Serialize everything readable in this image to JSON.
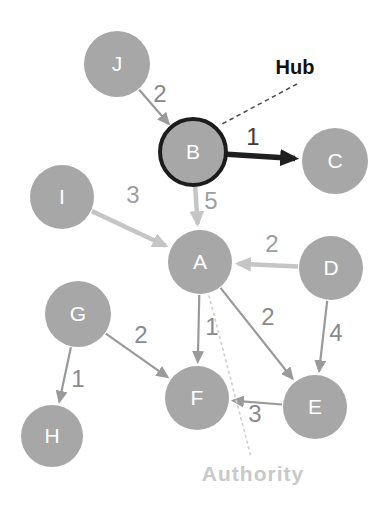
{
  "figure": {
    "width": 387,
    "height": 510
  },
  "colors": {
    "background": "#ffffff",
    "node_fill": "#a7a7a7",
    "node_letter": "#ffffff",
    "hub_ring": "#1c1c1c",
    "edge_normal": "#9a9a9a",
    "edge_highlight": "#c5c5c5",
    "edge_hub": "#1f1f1f",
    "label_normal": "#8a8a8a",
    "label_highlight": "#9e9e9e",
    "label_hub_edge": "#3c3c3c",
    "hub_text": "#111111",
    "authority_text": "#c9c9c9",
    "hub_leader": "#4a4a4a",
    "authority_leader": "#d0d0d0"
  },
  "graph": {
    "nodes": [
      {
        "id": "J",
        "label": "J",
        "x": 117,
        "y": 64,
        "r": 33,
        "role": "plain"
      },
      {
        "id": "B",
        "label": "B",
        "x": 193,
        "y": 152,
        "r": 33,
        "role": "hub"
      },
      {
        "id": "C",
        "label": "C",
        "x": 335,
        "y": 161,
        "r": 33,
        "role": "plain"
      },
      {
        "id": "I",
        "label": "I",
        "x": 62,
        "y": 197,
        "r": 32,
        "role": "plain"
      },
      {
        "id": "A",
        "label": "A",
        "x": 200,
        "y": 262,
        "r": 32,
        "role": "authority"
      },
      {
        "id": "D",
        "label": "D",
        "x": 331,
        "y": 268,
        "r": 32,
        "role": "plain"
      },
      {
        "id": "G",
        "label": "G",
        "x": 78,
        "y": 314,
        "r": 33,
        "role": "plain"
      },
      {
        "id": "F",
        "label": "F",
        "x": 197,
        "y": 398,
        "r": 32,
        "role": "plain"
      },
      {
        "id": "E",
        "label": "E",
        "x": 315,
        "y": 407,
        "r": 32,
        "role": "plain"
      },
      {
        "id": "H",
        "label": "H",
        "x": 52,
        "y": 436,
        "r": 31,
        "role": "plain"
      }
    ],
    "edges": [
      {
        "from": "J",
        "to": "B",
        "weight": "2",
        "style": "normal",
        "lx": 160,
        "ly": 102
      },
      {
        "from": "B",
        "to": "C",
        "weight": "1",
        "style": "hub",
        "lx": 253,
        "ly": 145
      },
      {
        "from": "B",
        "to": "A",
        "weight": "5",
        "style": "highlight",
        "lx": 211,
        "ly": 209
      },
      {
        "from": "I",
        "to": "A",
        "weight": "3",
        "style": "highlight",
        "lx": 133,
        "ly": 203
      },
      {
        "from": "D",
        "to": "A",
        "weight": "2",
        "style": "highlight",
        "lx": 272,
        "ly": 252
      },
      {
        "from": "A",
        "to": "F",
        "weight": "1",
        "style": "normal",
        "lx": 212,
        "ly": 335
      },
      {
        "from": "A",
        "to": "E",
        "weight": "2",
        "style": "normal",
        "lx": 268,
        "ly": 325
      },
      {
        "from": "D",
        "to": "E",
        "weight": "4",
        "style": "normal",
        "lx": 336,
        "ly": 341
      },
      {
        "from": "E",
        "to": "F",
        "weight": "3",
        "style": "normal",
        "lx": 255,
        "ly": 422
      },
      {
        "from": "G",
        "to": "F",
        "weight": "2",
        "style": "normal",
        "lx": 141,
        "ly": 343
      },
      {
        "from": "G",
        "to": "H",
        "weight": "1",
        "style": "normal",
        "lx": 78,
        "ly": 387
      }
    ]
  },
  "annotations": {
    "hub": {
      "label": "Hub",
      "x": 295,
      "y": 74,
      "leader": {
        "x1": 297,
        "y1": 84,
        "x2": 222,
        "y2": 124,
        "style": "dashed"
      }
    },
    "authority": {
      "label": "Authority",
      "x": 253,
      "y": 481,
      "leader": {
        "x1": 209,
        "y1": 296,
        "x2": 251,
        "y2": 457,
        "style": "dotted"
      }
    }
  }
}
